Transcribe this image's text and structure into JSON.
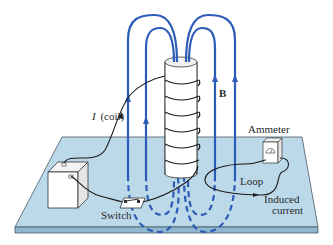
{
  "figure": {
    "colors": {
      "field_line": "#2d5cb8",
      "board_top": "#bcd9ea",
      "board_edge": "#8fb7d0",
      "board_outline": "#4a5a66",
      "wire": "#1a1a1a",
      "cylinder_fill": "#ffffff",
      "cylinder_outline": "#333333"
    }
  },
  "labels": {
    "coil_current_symbol": "I",
    "coil_current_text": "(coil)",
    "field": "B",
    "ammeter": "Ammeter",
    "loop": "Loop",
    "induced_line1": "Induced",
    "induced_line2": "current",
    "switch": "Switch"
  },
  "components": [
    {
      "name": "battery",
      "icon": "battery-icon"
    },
    {
      "name": "switch",
      "icon": "switch-icon"
    },
    {
      "name": "coil",
      "icon": "solenoid-icon"
    },
    {
      "name": "ammeter",
      "icon": "ammeter-icon"
    },
    {
      "name": "loop",
      "icon": "wire-loop-icon"
    }
  ]
}
